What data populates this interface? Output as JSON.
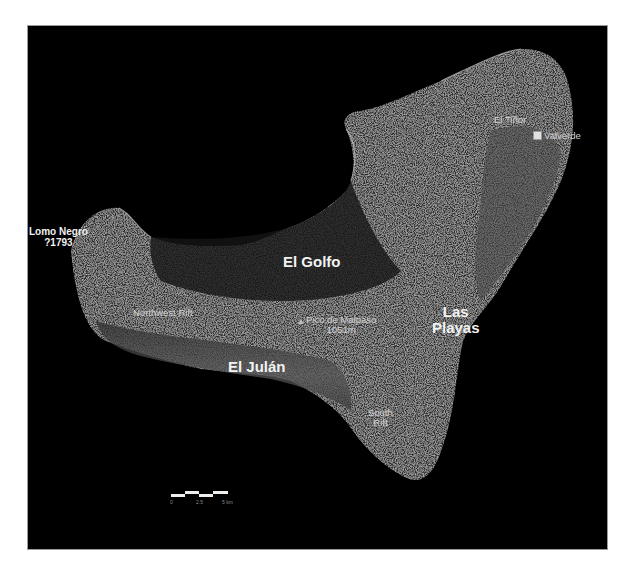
{
  "map": {
    "title": "El Hierro island relief map",
    "background_color": "#000000",
    "land_color": "#3a3a3a",
    "labels": {
      "el_golfo": "El Golfo",
      "el_julan": "El Julán",
      "las_playas_line1": "Las",
      "las_playas_line2": "Playas",
      "lomo_negro_line1": "Lomo Negro",
      "lomo_negro_line2": "?1793",
      "el_tinor": "El Tiñor",
      "valverde": "Valverde",
      "northwest_rift": "Northwest Rift",
      "pico_line1": "Pico de Malpaso",
      "pico_line2": "1051m",
      "south_rift_line1": "South",
      "south_rift_line2": "Rift"
    },
    "scale_bar": {
      "ticks": [
        "0",
        "2.5",
        "5 km"
      ]
    }
  }
}
